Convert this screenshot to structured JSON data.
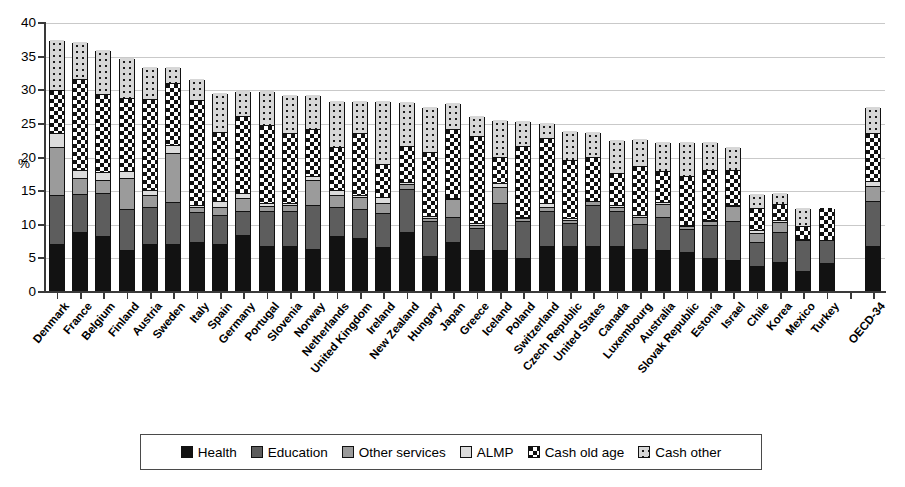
{
  "axis": {
    "ylabel": "%",
    "yticks": [
      0,
      5,
      10,
      15,
      20,
      25,
      30,
      35,
      40
    ],
    "ylim": [
      0,
      40
    ]
  },
  "legend": {
    "items": [
      {
        "label": "Health",
        "key": "health",
        "color": "#121212",
        "pattern": "solid"
      },
      {
        "label": "Education",
        "key": "education",
        "color": "#5d5d5d",
        "pattern": "solid"
      },
      {
        "label": "Other services",
        "key": "other",
        "color": "#9b9b9b",
        "pattern": "solid"
      },
      {
        "label": "ALMP",
        "key": "almp",
        "color": "#dcdcdc",
        "pattern": "solid"
      },
      {
        "label": "Cash old age",
        "key": "oldage",
        "color": "#111111",
        "pattern": "checker"
      },
      {
        "label": "Cash other",
        "key": "cashother",
        "color": "#d7d7d7",
        "pattern": "dots"
      }
    ]
  },
  "chart_data": {
    "type": "bar",
    "stacked": true,
    "title": "",
    "xlabel": "",
    "ylabel": "%",
    "ylim": [
      0,
      40
    ],
    "yticks": [
      0,
      5,
      10,
      15,
      20,
      25,
      30,
      35,
      40
    ],
    "grid": true,
    "legend_position": "bottom",
    "categories": [
      "Denmark",
      "France",
      "Belgium",
      "Finland",
      "Austria",
      "Sweden",
      "Italy",
      "Spain",
      "Germany",
      "Portugal",
      "Slovenia",
      "Norway",
      "Netherlands",
      "United Kingdom",
      "Ireland",
      "New Zealand",
      "Hungary",
      "Japan",
      "Greece",
      "Iceland",
      "Poland",
      "Switzerland",
      "Czech Republic",
      "United States",
      "Canada",
      "Luxembourg",
      "Australia",
      "Slovak Republic",
      "Estonia",
      "Israel",
      "Chile",
      "Korea",
      "Mexico",
      "Turkey",
      "",
      "OECD-34"
    ],
    "series": [
      {
        "name": "Health",
        "values": [
          6.8,
          8.7,
          8.1,
          5.9,
          6.8,
          6.8,
          7.2,
          6.8,
          8.2,
          6.6,
          6.5,
          6.1,
          8.0,
          7.7,
          6.4,
          8.7,
          5.1,
          7.2,
          5.9,
          6.0,
          4.8,
          6.6,
          6.5,
          6.6,
          6.5,
          6.1,
          6.0,
          5.7,
          4.8,
          4.5,
          3.5,
          4.2,
          2.8,
          4.0,
          0,
          6.6
        ]
      },
      {
        "name": "Education",
        "values": [
          7.4,
          5.6,
          6.4,
          6.2,
          5.5,
          6.3,
          4.4,
          4.3,
          3.6,
          5.2,
          5.3,
          6.5,
          4.4,
          4.3,
          5.0,
          6.3,
          5.1,
          3.6,
          3.3,
          6.9,
          5.5,
          5.1,
          3.4,
          6.0,
          5.2,
          3.7,
          4.8,
          3.4,
          4.9,
          5.7,
          3.6,
          4.5,
          4.6,
          3.4,
          0,
          6.7
        ]
      },
      {
        "name": "Other services",
        "values": [
          7.0,
          2.4,
          1.9,
          4.6,
          1.9,
          7.3,
          0.7,
          1.3,
          1.9,
          0.7,
          0.8,
          3.8,
          1.7,
          1.8,
          1.5,
          0.8,
          0.5,
          2.7,
          0.5,
          2.4,
          0.4,
          0.7,
          0.5,
          0.6,
          0.7,
          1.0,
          2.0,
          0.4,
          0.5,
          2.3,
          1.4,
          1.4,
          0.2,
          0.0,
          0,
          2.2
        ]
      },
      {
        "name": "ALMP",
        "values": [
          2.1,
          1.1,
          1.2,
          1.0,
          0.7,
          1.1,
          0.4,
          0.8,
          0.7,
          0.5,
          0.3,
          0.5,
          0.7,
          0.3,
          0.9,
          0.3,
          0.3,
          0.2,
          0.2,
          0.6,
          0.2,
          0.5,
          0.3,
          0.1,
          0.3,
          0.4,
          0.3,
          0.2,
          0.2,
          0.2,
          0.4,
          0.3,
          0.0,
          0.0,
          0,
          0.7
        ]
      },
      {
        "name": "Cash old age",
        "values": [
          6.4,
          13.6,
          11.5,
          10.8,
          13.5,
          9.3,
          15.6,
          10.3,
          11.5,
          11.5,
          10.4,
          7.1,
          6.5,
          9.2,
          5.0,
          5.3,
          9.5,
          10.2,
          13.0,
          3.9,
          10.5,
          9.7,
          8.7,
          6.5,
          4.7,
          7.3,
          4.6,
          7.3,
          7.4,
          5.2,
          3.3,
          2.4,
          1.9,
          5.0,
          0,
          7.1
        ]
      },
      {
        "name": "Cash other",
        "values": [
          7.7,
          5.6,
          6.8,
          6.2,
          4.9,
          2.5,
          3.3,
          6.0,
          3.9,
          5.3,
          5.8,
          5.2,
          6.9,
          5.0,
          9.4,
          6.7,
          6.8,
          4.1,
          3.1,
          5.6,
          3.9,
          2.4,
          4.4,
          3.8,
          5.1,
          4.1,
          4.5,
          5.2,
          4.4,
          3.5,
          2.2,
          1.8,
          2.9,
          0.0,
          0,
          4.0
        ]
      }
    ]
  }
}
